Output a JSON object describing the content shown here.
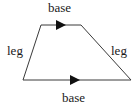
{
  "diagram": {
    "colors": {
      "stroke": "#3a3a3a",
      "arrow": "#111111",
      "text": "#1a1a1a",
      "background": "#ffffff"
    },
    "vertices": {
      "top_left": [
        41,
        25
      ],
      "top_right": [
        81,
        25
      ],
      "bottom_right": [
        131,
        80
      ],
      "bottom_left": [
        23,
        80
      ]
    },
    "labels": {
      "top_base": "base",
      "bottom_base": "base",
      "left_leg": "leg",
      "right_leg": "leg"
    },
    "arrows": [
      {
        "edge": "top_base",
        "direction": "right",
        "at": [
          62,
          25
        ]
      },
      {
        "edge": "bottom_base",
        "direction": "right",
        "at": [
          76,
          80
        ]
      }
    ]
  }
}
